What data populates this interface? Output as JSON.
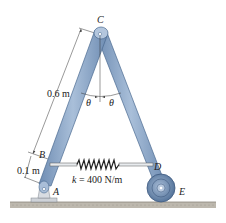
{
  "figure": {
    "type": "mechanism diagram",
    "points": {
      "A": "A",
      "B": "B",
      "C": "C",
      "D": "D",
      "E": "E"
    },
    "dimensions": {
      "CB": "0.6 m",
      "BA": "0.1 m"
    },
    "angle_symbol": "θ",
    "spring": {
      "label_k": "k",
      "label_value": " = 400 N/m"
    },
    "colors": {
      "link": "#8fa9c7",
      "link_edge": "#4a6a90",
      "wheel": "#6f8fb5",
      "ground": "#b3aea4",
      "base": "#c9ced6"
    }
  }
}
